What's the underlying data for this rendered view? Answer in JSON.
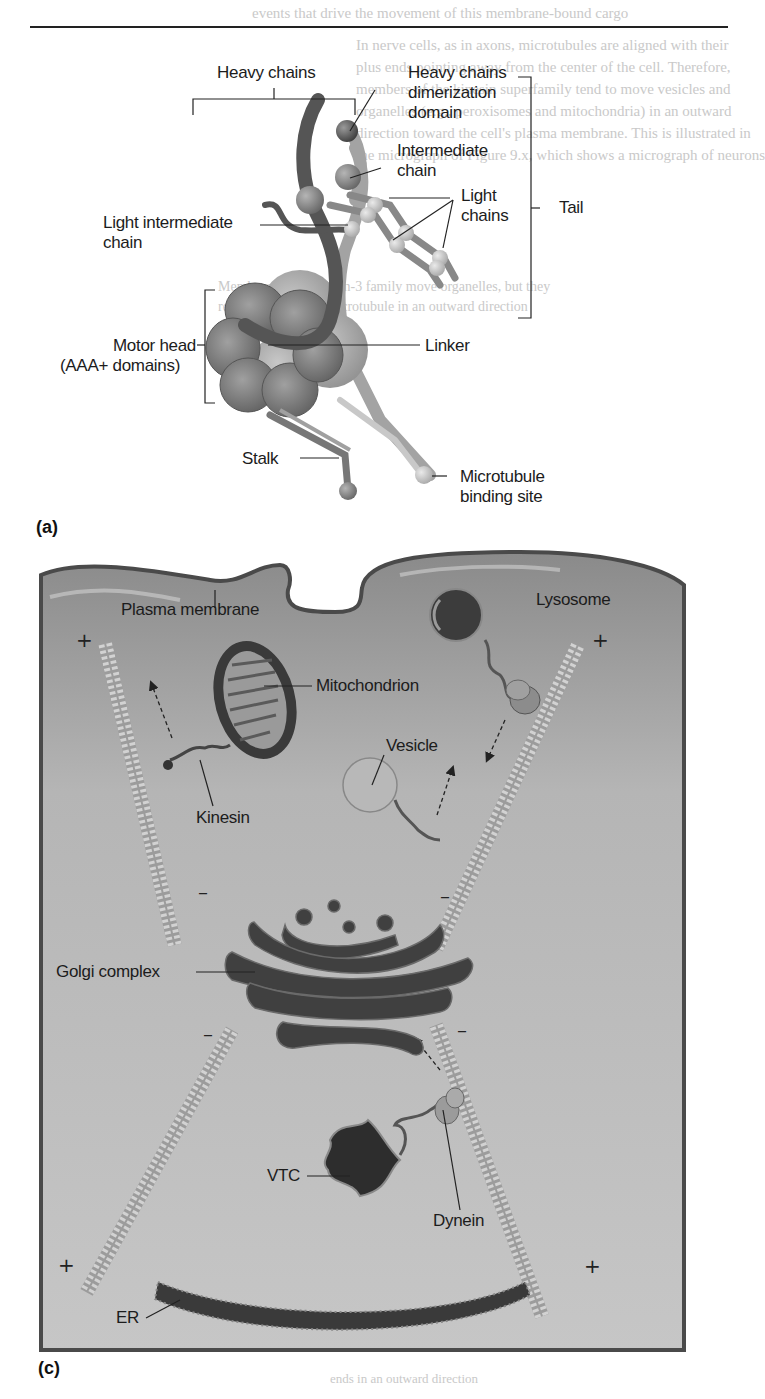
{
  "figure": {
    "background_text": {
      "line1": "events that drive the movement of this membrane-bound cargo",
      "line2": "In nerve cells, as in axons, microtubules are aligned with their",
      "line3": "plus ends pointing away from the center of the cell. Therefore,",
      "line4": "members of the kinesin superfamily tend to move vesicles and",
      "line5": "organelles (e.g., peroxisomes and mitochondria) in an outward",
      "line6": "direction toward the cell's plasma membrane. This is illustrated in",
      "line7": "the micrograph of Figure 9.x, which shows a micrograph of neurons",
      "line8": "Members of the kinesin-3 family move organelles, but they",
      "line9": "reach the tip of the microtubule in an outward direction",
      "line10": "ends in an outward direction"
    },
    "panel_a": {
      "label": "(a)",
      "title_colors": {
        "dark_chain": "#555555",
        "light_chain": "#9a9a9a",
        "light_chain_balls": "#bdbdbd",
        "motor_head": "#7a7a7a"
      },
      "labels": {
        "heavy_chains": "Heavy chains",
        "dimerization_line1": "Heavy chains",
        "dimerization_line2": "dimerization",
        "dimerization_line3": "domain",
        "intermediate_line1": "Intermediate",
        "intermediate_line2": "chain",
        "light_chains_line1": "Light",
        "light_chains_line2": "chains",
        "tail": "Tail",
        "light_intermediate_line1": "Light intermediate",
        "light_intermediate_line2": "chain",
        "motor_head_line1": "Motor head",
        "motor_head_line2": "(AAA+ domains)",
        "linker": "Linker",
        "stalk": "Stalk",
        "mt_binding_line1": "Microtubule",
        "mt_binding_line2": "binding site"
      }
    },
    "panel_c": {
      "label": "(c)",
      "colors": {
        "cytoplasm_top": "#8e8e8e",
        "cytoplasm_bottom": "#c4c4c4",
        "membrane": "#5a5a5a",
        "organelle_dark": "#3d3d3d"
      },
      "labels": {
        "plasma_membrane": "Plasma membrane",
        "lysosome": "Lysosome",
        "mitochondrion": "Mitochondrion",
        "kinesin": "Kinesin",
        "vesicle": "Vesicle",
        "golgi": "Golgi complex",
        "vtc": "VTC",
        "dynein": "Dynein",
        "er": "ER"
      },
      "signs": {
        "plus": "+",
        "minus": "–"
      }
    }
  }
}
